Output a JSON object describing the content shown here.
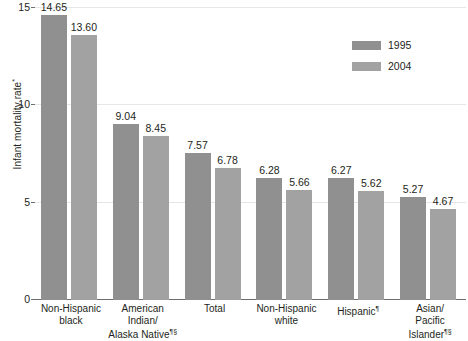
{
  "chart_data": {
    "type": "bar",
    "title": "",
    "xlabel": "",
    "ylabel": "Infant mortality rate",
    "ylabel_footnote": "*",
    "ylim": [
      0,
      15
    ],
    "yticks": [
      0,
      5,
      10,
      15
    ],
    "ytick_labels": [
      "0",
      "5",
      "10",
      "15"
    ],
    "grid": true,
    "legend_position": "upper right",
    "categories": [
      "Non-Hispanic black",
      "American Indian/ Alaska Native",
      "Total",
      "Non-Hispanic white",
      "Hispanic",
      "Asian/ Pacific Islander"
    ],
    "category_lines": [
      [
        "Non-Hispanic",
        "black"
      ],
      [
        "American",
        "Indian/",
        "Alaska Native"
      ],
      [
        "Total"
      ],
      [
        "Non-Hispanic",
        "white"
      ],
      [
        "Hispanic"
      ],
      [
        "Asian/",
        "Pacific Islander"
      ]
    ],
    "category_footnotes": [
      "",
      "¶§",
      "",
      "",
      "¶",
      "¶§"
    ],
    "series": [
      {
        "name": "1995",
        "color": "#909090",
        "values": [
          14.65,
          9.04,
          7.57,
          6.28,
          6.27,
          5.27
        ],
        "labels": [
          "14.65",
          "9.04",
          "7.57",
          "6.28",
          "6.27",
          "5.27"
        ]
      },
      {
        "name": "2004",
        "color": "#a2a2a2",
        "values": [
          13.6,
          8.45,
          6.78,
          5.66,
          5.62,
          4.67
        ],
        "labels": [
          "13.60",
          "8.45",
          "6.78",
          "5.66",
          "5.62",
          "4.67"
        ]
      }
    ]
  },
  "legend": {
    "items": [
      {
        "label": "1995",
        "color": "#909090"
      },
      {
        "label": "2004",
        "color": "#a2a2a2"
      }
    ]
  }
}
